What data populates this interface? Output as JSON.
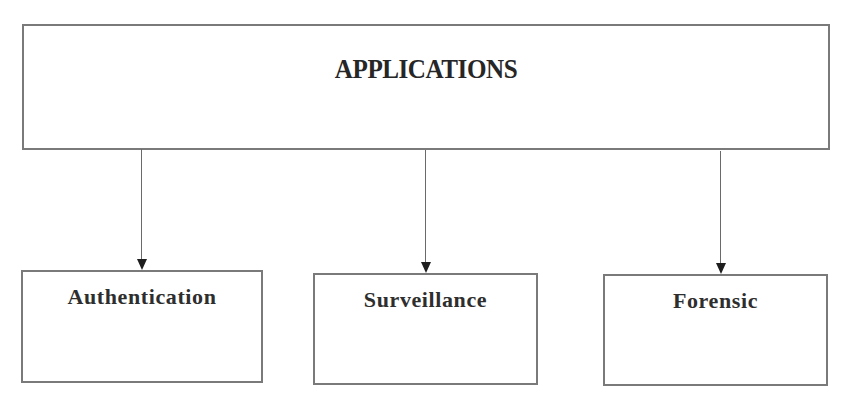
{
  "diagram": {
    "type": "hierarchy",
    "root": {
      "label": "APPLICATIONS"
    },
    "children": [
      {
        "label": "Authentication"
      },
      {
        "label": "Surveillance"
      },
      {
        "label": "Forensic"
      }
    ],
    "edges": [
      {
        "from": "APPLICATIONS",
        "to": "Authentication",
        "style": "arrow"
      },
      {
        "from": "APPLICATIONS",
        "to": "Surveillance",
        "style": "arrow"
      },
      {
        "from": "APPLICATIONS",
        "to": "Forensic",
        "style": "arrow"
      }
    ],
    "colors": {
      "border": "#7a7a7a",
      "text": "#2b2b2b",
      "background": "#ffffff"
    }
  }
}
